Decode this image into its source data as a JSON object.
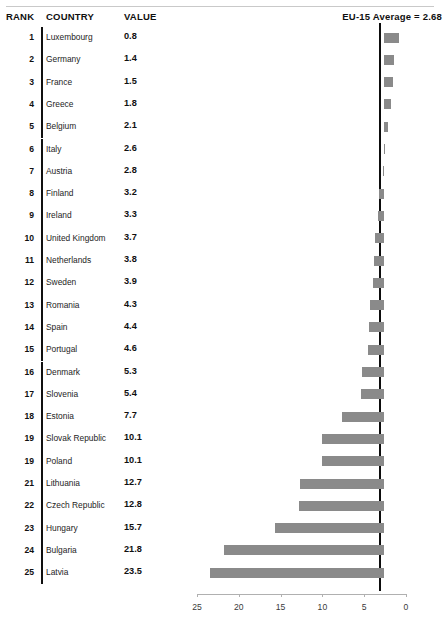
{
  "table": {
    "columns": {
      "rank": "RANK",
      "country": "COUNTRY",
      "value": "VALUE"
    },
    "average_label": "EU-15 Average = 2.68"
  },
  "caption": "",
  "colors": {
    "bar": "#8a8a8a",
    "reference_line": "#0d0d0d",
    "axis": "#b0b0b0",
    "text": "#101010"
  },
  "chart_data": {
    "type": "bar",
    "title": "",
    "subtitle": "",
    "xlabel": "",
    "ylabel": "",
    "orientation": "horizontal",
    "x_axis_reversed": true,
    "xlim": [
      25,
      0
    ],
    "xticks": [
      25,
      20,
      15,
      10,
      5,
      0
    ],
    "xtick_labels": [
      "25",
      "20",
      "15",
      "10",
      "5",
      "0"
    ],
    "grid": false,
    "legend": null,
    "reference_line": {
      "label": "EU-15 Average = 2.68",
      "value": 2.68
    },
    "note": "Bars are drawn from the EU-15 average reference line; values below the average extend to the right, values above extend to the left.",
    "categories": [
      "Luxembourg",
      "Germany",
      "France",
      "Greece",
      "Belgium",
      "Italy",
      "Austria",
      "Finland",
      "Ireland",
      "United Kingdom",
      "Netherlands",
      "Sweden",
      "Romania",
      "Spain",
      "Portugal",
      "Denmark",
      "Slovenia",
      "Estonia",
      "Slovak Republic",
      "Poland",
      "Lithuania",
      "Czech Republic",
      "Hungary",
      "Bulgaria",
      "Latvia"
    ],
    "values": [
      0.8,
      1.4,
      1.5,
      1.8,
      2.1,
      2.6,
      2.8,
      3.2,
      3.3,
      3.7,
      3.8,
      3.9,
      4.3,
      4.4,
      4.6,
      5.3,
      5.4,
      7.7,
      10.1,
      10.1,
      12.7,
      12.8,
      15.7,
      21.8,
      23.5
    ],
    "ranks": [
      "1",
      "2",
      "3",
      "4",
      "5",
      "6",
      "7",
      "8",
      "9",
      "10",
      "11",
      "12",
      "13",
      "14",
      "15",
      "16",
      "17",
      "18",
      "19",
      "19",
      "21",
      "22",
      "23",
      "24",
      "25"
    ]
  },
  "rows": [
    {
      "rank": "1",
      "country": "Luxembourg",
      "value": "0.8"
    },
    {
      "rank": "2",
      "country": "Germany",
      "value": "1.4"
    },
    {
      "rank": "3",
      "country": "France",
      "value": "1.5"
    },
    {
      "rank": "4",
      "country": "Greece",
      "value": "1.8"
    },
    {
      "rank": "5",
      "country": "Belgium",
      "value": "2.1"
    },
    {
      "rank": "6",
      "country": "Italy",
      "value": "2.6"
    },
    {
      "rank": "7",
      "country": "Austria",
      "value": "2.8"
    },
    {
      "rank": "8",
      "country": "Finland",
      "value": "3.2"
    },
    {
      "rank": "9",
      "country": "Ireland",
      "value": "3.3"
    },
    {
      "rank": "10",
      "country": "United Kingdom",
      "value": "3.7"
    },
    {
      "rank": "11",
      "country": "Netherlands",
      "value": "3.8"
    },
    {
      "rank": "12",
      "country": "Sweden",
      "value": "3.9"
    },
    {
      "rank": "13",
      "country": "Romania",
      "value": "4.3"
    },
    {
      "rank": "14",
      "country": "Spain",
      "value": "4.4"
    },
    {
      "rank": "15",
      "country": "Portugal",
      "value": "4.6"
    },
    {
      "rank": "16",
      "country": "Denmark",
      "value": "5.3"
    },
    {
      "rank": "17",
      "country": "Slovenia",
      "value": "5.4"
    },
    {
      "rank": "18",
      "country": "Estonia",
      "value": "7.7"
    },
    {
      "rank": "19",
      "country": "Slovak Republic",
      "value": "10.1"
    },
    {
      "rank": "19",
      "country": "Poland",
      "value": "10.1"
    },
    {
      "rank": "21",
      "country": "Lithuania",
      "value": "12.7"
    },
    {
      "rank": "22",
      "country": "Czech Republic",
      "value": "12.8"
    },
    {
      "rank": "23",
      "country": "Hungary",
      "value": "15.7"
    },
    {
      "rank": "24",
      "country": "Bulgaria",
      "value": "21.8"
    },
    {
      "rank": "25",
      "country": "Latvia",
      "value": "23.5"
    }
  ]
}
